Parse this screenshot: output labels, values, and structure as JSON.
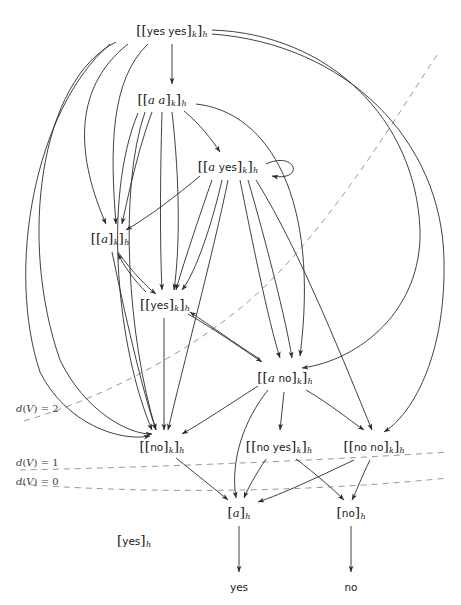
{
  "figure": {
    "type": "directed-graph",
    "title": "",
    "background": "#ffffff",
    "edge_color": "#2b2b2b",
    "dashed_color": "#8d8d8d"
  },
  "nodes": [
    {
      "id": "yesyes",
      "text_html": "<span class='br'>[[</span><span class='up'>yes yes</span><span class='br'>]</span><span class='sub'>k</span><span class='br'>]</span><span class='sub'>h</span>",
      "plain": "[[yes yes]k]h",
      "x": 172,
      "y": 31
    },
    {
      "id": "aa",
      "text_html": "<span class='br'>[[</span><span class='it'>a a</span><span class='br'>]</span><span class='sub'>k</span><span class='br'>]</span><span class='sub'>h</span>",
      "plain": "[[a a]k]h",
      "x": 162,
      "y": 100
    },
    {
      "id": "ayes",
      "text_html": "<span class='br'>[[</span><span class='it'>a</span> <span class='up'>yes</span><span class='br'>]</span><span class='sub'>k</span><span class='br'>]</span><span class='sub'>h</span>",
      "plain": "[[a yes]k]h",
      "x": 228,
      "y": 167
    },
    {
      "id": "a",
      "text_html": "<span class='br'>[[</span><span class='it'>a</span><span class='br'>]</span><span class='sub'>k</span><span class='br'>]</span><span class='sub'>h</span>",
      "plain": "[[a]k]h",
      "x": 110,
      "y": 239
    },
    {
      "id": "yes",
      "text_html": "<span class='br'>[[</span><span class='up'>yes</span><span class='br'>]</span><span class='sub'>k</span><span class='br'>]</span><span class='sub'>h</span>",
      "plain": "[[yes]k]h",
      "x": 165,
      "y": 305
    },
    {
      "id": "ano",
      "text_html": "<span class='br'>[[</span><span class='it'>a</span> <span class='up'>no</span><span class='br'>]</span><span class='sub'>k</span><span class='br'>]</span><span class='sub'>h</span>",
      "plain": "[[a no]k]h",
      "x": 285,
      "y": 378
    },
    {
      "id": "no",
      "text_html": "<span class='br'>[[</span><span class='up'>no</span><span class='br'>]</span><span class='sub'>k</span><span class='br'>]</span><span class='sub'>h</span>",
      "plain": "[[no]k]h",
      "x": 162,
      "y": 447
    },
    {
      "id": "noyes",
      "text_html": "<span class='br'>[[</span><span class='up'>no yes</span><span class='br'>]</span><span class='sub'>k</span><span class='br'>]</span><span class='sub'>h</span>",
      "plain": "[[no yes]k]h",
      "x": 279,
      "y": 447
    },
    {
      "id": "nono",
      "text_html": "<span class='br'>[[</span><span class='up'>no no</span><span class='br'>]</span><span class='sub'>k</span><span class='br'>]</span><span class='sub'>h</span>",
      "plain": "[[no no]k]h",
      "x": 374,
      "y": 447
    },
    {
      "id": "ah",
      "text_html": "<span class='br'>[</span><span class='it'>a</span><span class='br'>]</span><span class='sub'>h</span>",
      "plain": "[a]h",
      "x": 239,
      "y": 513
    },
    {
      "id": "noh",
      "text_html": "<span class='br'>[</span><span class='up'>no</span><span class='br'>]</span><span class='sub'>h</span>",
      "plain": "[no]h",
      "x": 351,
      "y": 513
    },
    {
      "id": "yesh",
      "text_html": "<span class='br'>[</span><span class='up'>yes</span><span class='br'>]</span><span class='sub'>h</span>",
      "plain": "[yes]h",
      "x": 134,
      "y": 541
    }
  ],
  "terminals": [
    {
      "id": "t-yes",
      "label": "yes",
      "x": 239,
      "y": 587
    },
    {
      "id": "t-no",
      "label": "no",
      "x": 351,
      "y": 587
    }
  ],
  "levels": [
    {
      "id": "d2",
      "label_html": "<span class='it'>d</span>(<span class='cal'>V</span>) = 2",
      "plain": "d(V) = 2",
      "label_x": 16,
      "label_y": 408
    },
    {
      "id": "d1",
      "label_html": "<span class='it'>d</span>(<span class='cal'>V</span>) = 1",
      "plain": "d(V) = 1",
      "label_x": 16,
      "label_y": 462
    },
    {
      "id": "d0",
      "label_html": "<span class='it'>d</span>(<span class='cal'>V</span>) = 0",
      "plain": "d(V) = 0",
      "label_x": 16,
      "label_y": 481
    }
  ],
  "dashed_paths": [
    {
      "id": "d2-line",
      "d": "M 437 55 C 400 110 330 230 250 300 C 190 352 100 400 20 422"
    },
    {
      "id": "d1-line",
      "d": "M 20 470 C 120 468 300 462 448 452"
    },
    {
      "id": "d0-line",
      "d": "M 20 484 C 120 492 280 495 448 478"
    }
  ],
  "edges": [
    {
      "id": "e1",
      "from": "yesyes",
      "to": "aa",
      "d": "M 172 44 L 172 84"
    },
    {
      "id": "e2",
      "from": "yesyes",
      "to": "a",
      "d": "M 148 44 C 110 80 110 150 116 224"
    },
    {
      "id": "e3",
      "from": "yesyes",
      "to": "a",
      "d": "M 128 44 C 70 90 78 160 106 224"
    },
    {
      "id": "e4",
      "from": "yesyes",
      "to": "no",
      "d": "M 116 42 C 40 80 18 240 60 360 C 85 412 130 435 152 434"
    },
    {
      "id": "e5",
      "from": "yesyes",
      "to": "no",
      "d": "M 110 44 C 34 110 6 270 40 372 C 66 424 120 442 150 436"
    },
    {
      "id": "e6",
      "from": "yesyes",
      "to": "ano",
      "d": "M 212 30 C 330 34 416 120 420 230 C 422 310 360 360 302 368"
    },
    {
      "id": "e7",
      "from": "yesyes",
      "to": "nono",
      "d": "M 212 34 C 346 44 442 140 444 260 C 446 360 410 416 384 432"
    },
    {
      "id": "e8",
      "from": "aa",
      "to": "ayes",
      "d": "M 184 111 C 200 124 212 140 220 152"
    },
    {
      "id": "e9",
      "from": "aa",
      "to": "a",
      "d": "M 152 112 C 138 150 128 196 122 224"
    },
    {
      "id": "e10",
      "from": "aa",
      "to": "yes",
      "d": "M 162 112 C 160 180 160 250 162 290"
    },
    {
      "id": "e11",
      "from": "aa",
      "to": "yes",
      "d": "M 172 112 C 180 182 180 248 174 290"
    },
    {
      "id": "e12",
      "from": "aa",
      "to": "no",
      "d": "M 145 112 C 118 190 128 340 156 430"
    },
    {
      "id": "e13",
      "from": "aa",
      "to": "no",
      "d": "M 138 113 C 102 200 118 350 152 430"
    },
    {
      "id": "e14",
      "from": "aa",
      "to": "ano",
      "d": "M 196 104 C 270 112 320 200 300 356"
    },
    {
      "id": "e15",
      "from": "ayes",
      "to": "ayes",
      "d": "M 266 164 C 296 150 306 182 272 176",
      "kind": "self-loop"
    },
    {
      "id": "e16",
      "from": "ayes",
      "to": "a",
      "d": "M 200 176 C 176 196 150 216 126 230"
    },
    {
      "id": "e17",
      "from": "ayes",
      "to": "yes",
      "d": "M 212 180 C 198 220 182 268 176 290"
    },
    {
      "id": "e18",
      "from": "ayes",
      "to": "yes",
      "d": "M 222 180 C 212 224 196 272 182 290"
    },
    {
      "id": "e19",
      "from": "ayes",
      "to": "no",
      "d": "M 228 180 C 214 250 182 370 168 430"
    },
    {
      "id": "e20",
      "from": "ayes",
      "to": "ano",
      "d": "M 240 180 C 252 240 268 320 280 358"
    },
    {
      "id": "e21",
      "from": "ayes",
      "to": "ano",
      "d": "M 248 180 C 266 242 286 320 292 358"
    },
    {
      "id": "e22",
      "from": "ayes",
      "to": "nono",
      "d": "M 256 180 C 300 250 348 372 372 430"
    },
    {
      "id": "e23",
      "from": "a",
      "to": "yes",
      "d": "M 118 252 C 132 272 148 288 156 294"
    },
    {
      "id": "e24",
      "from": "yes",
      "to": "a",
      "d": "M 146 292 C 134 280 124 266 118 254"
    },
    {
      "id": "e25",
      "from": "a",
      "to": "no",
      "d": "M 112 252 C 124 310 142 390 156 430"
    },
    {
      "id": "e26",
      "from": "yes",
      "to": "ano",
      "d": "M 188 314 C 216 330 244 350 262 362"
    },
    {
      "id": "e27",
      "from": "ano",
      "to": "yes",
      "d": "M 258 358 C 236 344 208 324 190 312"
    },
    {
      "id": "e28",
      "from": "yes",
      "to": "no",
      "d": "M 164 318 L 164 430"
    },
    {
      "id": "e29",
      "from": "ano",
      "to": "no",
      "d": "M 258 386 C 230 404 200 424 182 434"
    },
    {
      "id": "e30",
      "from": "ano",
      "to": "noyes",
      "d": "M 284 392 L 280 430"
    },
    {
      "id": "e31",
      "from": "ano",
      "to": "nono",
      "d": "M 306 390 C 330 404 352 422 364 430"
    },
    {
      "id": "e32",
      "from": "ano",
      "to": "ah",
      "d": "M 268 390 C 244 420 230 460 236 498"
    },
    {
      "id": "e33",
      "from": "no",
      "to": "ah",
      "d": "M 176 458 C 196 474 216 490 228 500"
    },
    {
      "id": "e34",
      "from": "noyes",
      "to": "ah",
      "d": "M 266 459 C 256 474 248 488 244 498"
    },
    {
      "id": "e35",
      "from": "noyes",
      "to": "noh",
      "d": "M 296 459 C 316 474 334 490 344 500"
    },
    {
      "id": "e36",
      "from": "nono",
      "to": "ah",
      "d": "M 354 460 C 316 478 282 494 258 502"
    },
    {
      "id": "e37",
      "from": "nono",
      "to": "noh",
      "d": "M 370 460 C 362 476 356 492 352 500"
    },
    {
      "id": "e38",
      "from": "ah",
      "to": "t-yes",
      "d": "M 239 526 L 239 572"
    },
    {
      "id": "e39",
      "from": "noh",
      "to": "t-no",
      "d": "M 351 526 L 351 572"
    }
  ]
}
